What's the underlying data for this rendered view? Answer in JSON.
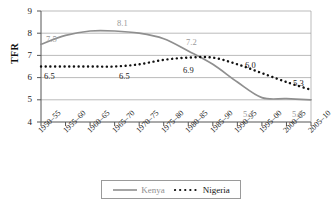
{
  "chart_data": {
    "type": "line",
    "title": "",
    "xlabel": "",
    "ylabel": "TFR",
    "ylim": [
      4,
      9
    ],
    "yticks": [
      4,
      5,
      6,
      7,
      8,
      9
    ],
    "grid": true,
    "legend_position": "bottom",
    "categories": [
      "1950–55",
      "1955–60",
      "1960–65",
      "1965–70",
      "1970–75",
      "1975–80",
      "1980–85",
      "1985–90",
      "1990–95",
      "1995–00",
      "2000–05",
      "2005–10"
    ],
    "series": [
      {
        "name": "Kenya",
        "style": "solid",
        "color": "#8f8f8f",
        "values": [
          7.5,
          7.9,
          8.1,
          8.1,
          8.0,
          7.75,
          7.2,
          6.6,
          5.8,
          5.1,
          5.05,
          5.0
        ]
      },
      {
        "name": "Nigeria",
        "style": "dotted",
        "color": "#111111",
        "values": [
          6.5,
          6.5,
          6.5,
          6.5,
          6.6,
          6.8,
          6.9,
          6.9,
          6.6,
          6.2,
          5.8,
          5.45
        ]
      }
    ],
    "annotations": [
      {
        "text": "7.5",
        "series": "Kenya",
        "category": "1950–55",
        "value": 7.5,
        "x": 46,
        "y": 35
      },
      {
        "text": "8.1",
        "series": "Kenya",
        "category": "1960–65",
        "value": 8.1,
        "x": 117,
        "y": 19
      },
      {
        "text": "7.2",
        "series": "Kenya",
        "category": "1980–85",
        "value": 7.2,
        "x": 186,
        "y": 38
      },
      {
        "text": "5.1",
        "series": "Kenya",
        "category": "1995–00",
        "value": 5.1,
        "x": 243,
        "y": 110
      },
      {
        "text": "5.0",
        "series": "Kenya",
        "category": "2005–10",
        "value": 5.0,
        "x": 292,
        "y": 110
      },
      {
        "text": "6.5",
        "series": "Nigeria",
        "category": "1950–55",
        "value": 6.5,
        "x": 44,
        "y": 72
      },
      {
        "text": "6.5",
        "series": "Nigeria",
        "category": "1965–70",
        "value": 6.5,
        "x": 119,
        "y": 72
      },
      {
        "text": "6.9",
        "series": "Nigeria",
        "category": "1980–85",
        "value": 6.9,
        "x": 183,
        "y": 66
      },
      {
        "text": "6.0",
        "series": "Nigeria",
        "category": "1995–00",
        "value": 6.0,
        "x": 245,
        "y": 61
      },
      {
        "text": "5.3",
        "series": "Nigeria",
        "category": "2005–10",
        "value": 5.3,
        "x": 293,
        "y": 79
      }
    ]
  },
  "legend": {
    "kenya_label": "Kenya",
    "nigeria_label": "Nigeria"
  },
  "yaxis": {
    "title": "TFR",
    "ticks": [
      "9",
      "8",
      "7",
      "6",
      "5",
      "4"
    ]
  }
}
